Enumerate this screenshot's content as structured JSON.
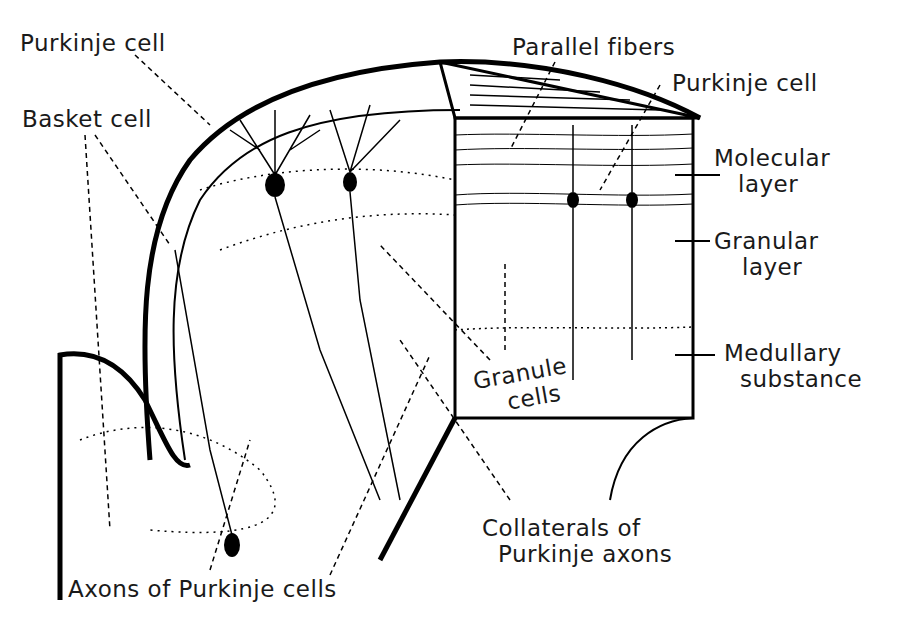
{
  "labels": {
    "purkinje_cell_left": "Purkinje cell",
    "basket_cell": "Basket cell",
    "parallel_fibers": "Parallel fibers",
    "purkinje_cell_right": "Purkinje cell",
    "molecular_layer_1": "Molecular",
    "molecular_layer_2": "layer",
    "granular_layer_1": "Granular",
    "granular_layer_2": "layer",
    "medullary_1": "Medullary",
    "medullary_2": "substance",
    "granule_cells_1": "Granule",
    "granule_cells_2": "cells",
    "collaterals_1": "Collaterals of",
    "collaterals_2": "Purkinje axons",
    "axons": "Axons of Purkinje cells"
  }
}
